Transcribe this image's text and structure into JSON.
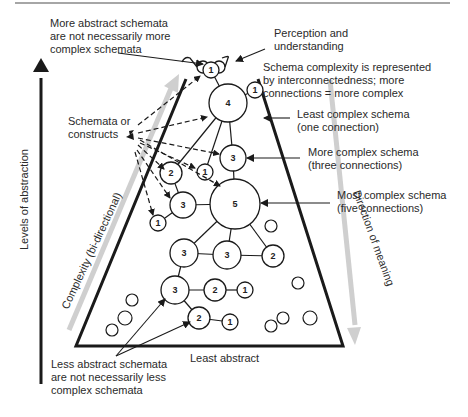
{
  "colors": {
    "ink": "#1a1a1a",
    "text": "#2a2a2a",
    "gray_arrow": "#cfcfcf",
    "background": "#ffffff"
  },
  "annotations": {
    "top_left": [
      "More abstract schemata",
      "are not necessarily more",
      "complex schemata"
    ],
    "perception": [
      "Perception and",
      "understanding"
    ],
    "complexity_def": [
      "Schema complexity is represented",
      "by interconnectedness; more",
      "connections = more complex"
    ],
    "least_complex": [
      "Least complex schema",
      "(one connection)"
    ],
    "more_complex": [
      "More complex schema",
      "(three connections)"
    ],
    "most_complex": [
      "Most complex schema",
      "(five connections)"
    ],
    "schemata_constructs": [
      "Schemata or",
      "constructs"
    ],
    "bottom_left": [
      "Less abstract schemata",
      "are not necessarily less",
      "complex schemata"
    ],
    "least_abstract": "Least abstract"
  },
  "axes": {
    "vertical_label": "Levels of abstraction",
    "left_diagonal_label": "Complexity (bi-directional)",
    "right_diagonal_label": "Direction of meaning"
  },
  "icons": {
    "glasses": "glasses-icon",
    "eye": "eye-icon"
  },
  "nodes": [
    {
      "id": "n1_top",
      "label": "1",
      "x": 211,
      "y": 70,
      "r": 8
    },
    {
      "id": "n4",
      "label": "4",
      "x": 228,
      "y": 103,
      "r": 19
    },
    {
      "id": "n1_right",
      "label": "1",
      "x": 255,
      "y": 90,
      "r": 8
    },
    {
      "id": "n3_upper",
      "label": "3",
      "x": 233,
      "y": 158,
      "r": 13
    },
    {
      "id": "n2_left",
      "label": "2",
      "x": 171,
      "y": 173,
      "r": 11
    },
    {
      "id": "n1_mid",
      "label": "1",
      "x": 205,
      "y": 172,
      "r": 8
    },
    {
      "id": "n3_left",
      "label": "3",
      "x": 183,
      "y": 205,
      "r": 13
    },
    {
      "id": "n1_low",
      "label": "1",
      "x": 158,
      "y": 223,
      "r": 8
    },
    {
      "id": "n5",
      "label": "5",
      "x": 235,
      "y": 204,
      "r": 25
    },
    {
      "id": "n3_a",
      "label": "3",
      "x": 184,
      "y": 253,
      "r": 14
    },
    {
      "id": "n3_b",
      "label": "3",
      "x": 227,
      "y": 255,
      "r": 14
    },
    {
      "id": "n2_right",
      "label": "2",
      "x": 273,
      "y": 256,
      "r": 11
    },
    {
      "id": "n3_c",
      "label": "3",
      "x": 175,
      "y": 290,
      "r": 14
    },
    {
      "id": "n2_c",
      "label": "2",
      "x": 215,
      "y": 290,
      "r": 11
    },
    {
      "id": "n1_c",
      "label": "1",
      "x": 245,
      "y": 290,
      "r": 8
    },
    {
      "id": "n2_d",
      "label": "2",
      "x": 199,
      "y": 318,
      "r": 11
    },
    {
      "id": "n1_d",
      "label": "1",
      "x": 230,
      "y": 322,
      "r": 8
    }
  ],
  "edges": [
    [
      "n1_top",
      "n4"
    ],
    [
      "n4",
      "n1_right"
    ],
    [
      "n4",
      "n3_upper"
    ],
    [
      "n4",
      "n2_left"
    ],
    [
      "n4",
      "n1_mid"
    ],
    [
      "n2_left",
      "n3_left"
    ],
    [
      "n3_left",
      "n1_low"
    ],
    [
      "n3_left",
      "n5"
    ],
    [
      "n5",
      "n3_upper"
    ],
    [
      "n5",
      "n3_a"
    ],
    [
      "n5",
      "n3_b"
    ],
    [
      "n5",
      "n2_right"
    ],
    [
      "n3_a",
      "n3_b"
    ],
    [
      "n3_b",
      "n2_right"
    ],
    [
      "n3_a",
      "n3_c"
    ],
    [
      "n3_c",
      "n2_c"
    ],
    [
      "n2_c",
      "n1_c"
    ],
    [
      "n3_c",
      "n2_d"
    ],
    [
      "n2_d",
      "n1_d"
    ]
  ],
  "isolated_circles": [
    {
      "x": 132,
      "y": 300,
      "r": 6
    },
    {
      "x": 125,
      "y": 318,
      "r": 7
    },
    {
      "x": 112,
      "y": 330,
      "r": 6
    },
    {
      "x": 271,
      "y": 226,
      "r": 6
    },
    {
      "x": 298,
      "y": 283,
      "r": 6
    },
    {
      "x": 271,
      "y": 326,
      "r": 6
    },
    {
      "x": 283,
      "y": 318,
      "r": 6
    },
    {
      "x": 310,
      "y": 318,
      "r": 7
    }
  ]
}
